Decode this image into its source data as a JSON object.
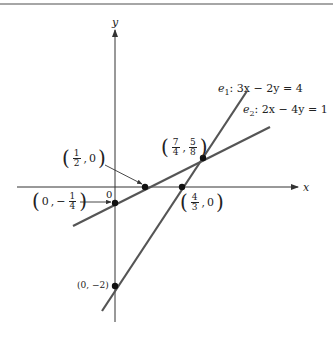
{
  "axes": {
    "x_label": "x",
    "y_label": "y",
    "origin_label": "0"
  },
  "lines": [
    {
      "id": "e1",
      "name": "e",
      "sub": "1",
      "equation": ": 3x − 2y = 4",
      "color": "#555555"
    },
    {
      "id": "e2",
      "name": "e",
      "sub": "2",
      "equation": ": 2x − 4y = 1",
      "color": "#555555"
    }
  ],
  "points": {
    "p_half": {
      "x_num": "1",
      "x_den": "2",
      "sep": ",",
      "y": "0"
    },
    "p_quarter": {
      "x": "0",
      "sep": ",",
      "y_sign": "−",
      "y_num": "1",
      "y_den": "4"
    },
    "p_int": {
      "x_num": "7",
      "x_den": "4",
      "sep": ",",
      "y_num": "5",
      "y_den": "8"
    },
    "p_fourthirds": {
      "x_num": "4",
      "x_den": "3",
      "sep": ",",
      "y": "0"
    },
    "p_minus2": {
      "label": "(0, −2)"
    }
  },
  "colors": {
    "axis": "#333333",
    "line": "#555555",
    "point": "#111111",
    "border": "#888888"
  }
}
